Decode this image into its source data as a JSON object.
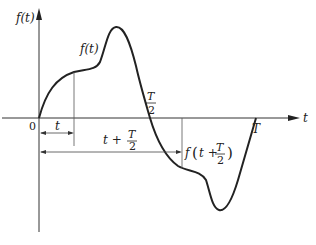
{
  "diagram": {
    "title": "",
    "y_axis_label": "f(t)",
    "x_axis_label": "t",
    "origin_label": "0",
    "curve_label": "f(t)",
    "half_period_label": {
      "num": "T",
      "den": "2"
    },
    "period_label": "T",
    "interval_t_label": "t",
    "interval_shift_label": {
      "prefix": "t +",
      "num": "T",
      "den": "2"
    },
    "shifted_value_label": {
      "prefix": "f",
      "open": "(",
      "inner": "t +",
      "num": "T",
      "den": "2",
      "close": ")"
    }
  },
  "colors": {
    "line": "#222222",
    "thin": "#444444",
    "background": "#ffffff"
  }
}
